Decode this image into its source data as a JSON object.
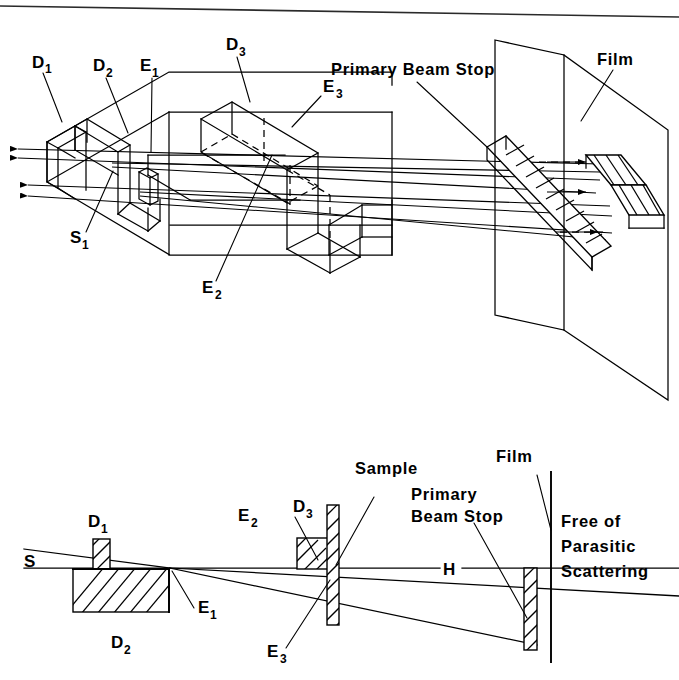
{
  "figure": {
    "rule_line": "top-horizontal-rule",
    "background_color": "#ffffff",
    "ink_color": "#000000"
  },
  "top_panel": {
    "name": "perspective-view",
    "labels": {
      "d1": "D",
      "d1_sub": "1",
      "d2": "D",
      "d2_sub": "2",
      "d3": "D",
      "d3_sub": "3",
      "e1": "E",
      "e1_sub": "1",
      "e2": "E",
      "e2_sub": "2",
      "e3": "E",
      "e3_sub": "3",
      "s1": "S",
      "s1_sub": "1",
      "primary_beam_stop": "Primary Beam  Stop",
      "film": "Film"
    }
  },
  "bottom_panel": {
    "name": "cross-section-view",
    "labels": {
      "s": "S",
      "h": "H",
      "d1": "D",
      "d1_sub": "1",
      "d2": "D",
      "d2_sub": "2",
      "d3": "D",
      "d3_sub": "3",
      "e1": "E",
      "e1_sub": "1",
      "e2": "E",
      "e2_sub": "2",
      "e3": "E",
      "e3_sub": "3",
      "sample": "Sample",
      "primary_beam_stop_line1": "Primary",
      "primary_beam_stop_line2": "Beam Stop",
      "film": "Film",
      "free_line1": "Free of",
      "free_line2": "Parasitic",
      "free_line3": "Scattering"
    }
  }
}
